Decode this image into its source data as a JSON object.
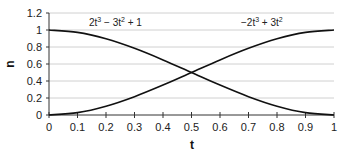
{
  "chart_data": {
    "type": "line",
    "title": "",
    "xlabel": "t",
    "ylabel": "n",
    "xlim": [
      0,
      1
    ],
    "ylim": [
      0,
      1.2
    ],
    "x_ticks": [
      "0",
      "0.1",
      "0.2",
      "0.3",
      "0.4",
      "0.5",
      "0.6",
      "0.7",
      "0.8",
      "0.9",
      "1"
    ],
    "y_ticks": [
      "0",
      "0.2",
      "0.4",
      "0.6",
      "0.8",
      "1",
      "1.2"
    ],
    "grid": "horizontal",
    "legend": "none",
    "series": [
      {
        "name": "2t^3 - 3t^2 + 1",
        "x": [
          0,
          0.1,
          0.2,
          0.3,
          0.4,
          0.5,
          0.6,
          0.7,
          0.8,
          0.9,
          1
        ],
        "values": [
          1,
          0.972,
          0.896,
          0.784,
          0.648,
          0.5,
          0.352,
          0.216,
          0.104,
          0.028,
          0
        ]
      },
      {
        "name": "-2t^3 + 3t^2",
        "x": [
          0,
          0.1,
          0.2,
          0.3,
          0.4,
          0.5,
          0.6,
          0.7,
          0.8,
          0.9,
          1
        ],
        "values": [
          0,
          0.028,
          0.104,
          0.216,
          0.352,
          0.5,
          0.648,
          0.784,
          0.896,
          0.972,
          1
        ]
      }
    ],
    "annotations": [
      {
        "text_main": "2t",
        "sup1": "3",
        "text_mid": " − 3t",
        "sup2": "2",
        "text_end": " + 1",
        "near_series": 0
      },
      {
        "text_main": "−2t",
        "sup1": "3",
        "text_mid": " + 3t",
        "sup2": "2",
        "text_end": "",
        "near_series": 1
      }
    ],
    "colors": {
      "line": "#111111",
      "grid": "#d0d0d0",
      "axis": "#333333"
    }
  }
}
